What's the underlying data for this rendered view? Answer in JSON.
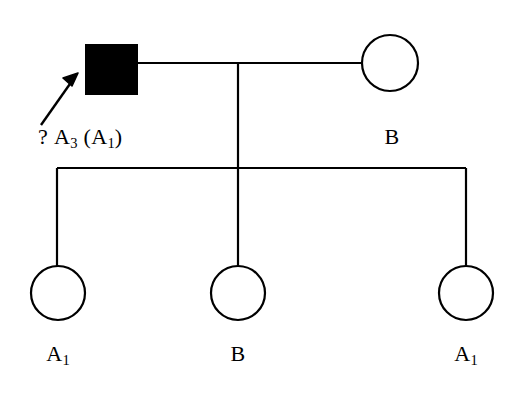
{
  "diagram": {
    "type": "pedigree-chart",
    "title": "",
    "line_color": "#000000",
    "affected_fill": "#000000",
    "unaffected_fill": "#ffffff",
    "generations": [
      {
        "generation": "I",
        "individuals": [
          {
            "id": "father",
            "sex": "male",
            "shape": "square",
            "affected": true,
            "label": "? A3 (A1)",
            "label_parts": {
              "unknown_marker": "?",
              "allele_main": "A",
              "allele_main_sub": "3",
              "allele_paren_open": "(",
              "allele_alt": "A",
              "allele_alt_sub": "1",
              "allele_paren_close": ")"
            },
            "proband_arrow": true,
            "cx": 111,
            "cy": 69
          },
          {
            "id": "mother",
            "sex": "female",
            "shape": "circle",
            "affected": false,
            "label": "B",
            "cx": 390,
            "cy": 63
          }
        ]
      },
      {
        "generation": "II",
        "individuals": [
          {
            "id": "child-1",
            "sex": "female",
            "shape": "circle",
            "affected": false,
            "label": "A1",
            "label_parts": {
              "allele_main": "A",
              "allele_main_sub": "1"
            },
            "cx": 58,
            "cy": 293
          },
          {
            "id": "child-2",
            "sex": "female",
            "shape": "circle",
            "affected": false,
            "label": "B",
            "label_parts": {
              "allele_main": "B",
              "allele_main_sub": ""
            },
            "cx": 238,
            "cy": 293
          },
          {
            "id": "child-3",
            "sex": "female",
            "shape": "circle",
            "affected": false,
            "label": "A1",
            "label_parts": {
              "allele_main": "A",
              "allele_main_sub": "1"
            },
            "cx": 466,
            "cy": 293
          }
        ]
      }
    ],
    "labels": {
      "father_unknown": "?",
      "father_allele": "A",
      "father_allele_sub": "3",
      "father_paren_open": "(",
      "father_alt_allele": "A",
      "father_alt_allele_sub": "1",
      "father_paren_close": ")",
      "mother_allele": "B",
      "child1_allele": "A",
      "child1_allele_sub": "1",
      "child2_allele": "B",
      "child3_allele": "A",
      "child3_allele_sub": "1"
    }
  }
}
